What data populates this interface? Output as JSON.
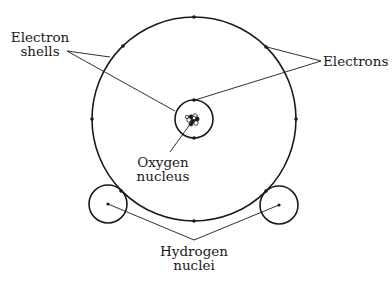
{
  "diagram": {
    "labels": {
      "electron_shells": [
        "Electron",
        "shells"
      ],
      "electrons": "Electrons",
      "oxygen_nucleus": [
        "Oxygen",
        "nucleus"
      ],
      "hydrogen_nuclei": [
        "Hydrogen",
        "nuclei"
      ]
    },
    "colors": {
      "stroke": "#1a1a1a",
      "background": "#ffffff"
    },
    "shells": [
      {
        "name": "outer-shell",
        "cx": 194,
        "cy": 119,
        "r": 102,
        "electron_count": 8
      },
      {
        "name": "inner-shell",
        "cx": 194,
        "cy": 119,
        "r": 19,
        "electron_count": 2
      }
    ],
    "hydrogen_atoms": [
      {
        "name": "left",
        "cx": 108,
        "cy": 204,
        "r": 19
      },
      {
        "name": "right",
        "cx": 279,
        "cy": 205,
        "r": 19
      }
    ]
  }
}
